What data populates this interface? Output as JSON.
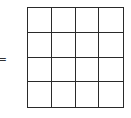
{
  "diagram": {
    "operator": "=",
    "grid": {
      "rows": 4,
      "columns": 4,
      "cells": [
        [
          "",
          "",
          "",
          ""
        ],
        [
          "",
          "",
          "",
          ""
        ],
        [
          "",
          "",
          "",
          ""
        ],
        [
          "",
          "",
          "",
          ""
        ]
      ],
      "line_color": "#2a2a2a",
      "fill_color": "#ffffff"
    }
  }
}
